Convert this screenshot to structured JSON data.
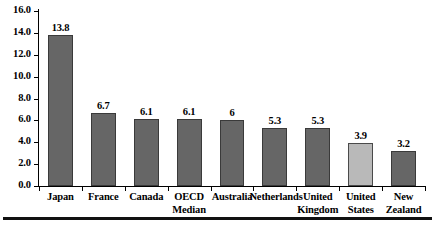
{
  "chart_data": {
    "type": "bar",
    "title": "",
    "subtitle": "",
    "xlabel": "",
    "ylabel": "",
    "ylim": [
      0,
      16
    ],
    "grid": false,
    "legend": "none",
    "categories": [
      "Japan",
      "France",
      "Canada",
      "OECD\nMedian",
      "Australia",
      "Netherlands",
      "United\nKingdom",
      "United\nStates",
      "New\nZealand"
    ],
    "values": [
      13.8,
      6.7,
      6.1,
      6.1,
      6,
      5.3,
      5.3,
      3.9,
      3.2
    ],
    "value_labels": [
      "13.8",
      "6.7",
      "6.1",
      "6.1",
      "6",
      "5.3",
      "5.3",
      "3.9",
      "3.2"
    ],
    "bar_styles": [
      "dark",
      "dark",
      "dark",
      "dark",
      "dark",
      "dark",
      "dark",
      "light",
      "dark"
    ],
    "yticks": [
      {
        "value": 16,
        "label": "16.0"
      },
      {
        "value": 14,
        "label": "14.0"
      },
      {
        "value": 12,
        "label": "12.0"
      },
      {
        "value": 10,
        "label": "10.0"
      },
      {
        "value": 8,
        "label": "8.0"
      },
      {
        "value": 6,
        "label": "6.0"
      },
      {
        "value": 4,
        "label": "4.0"
      },
      {
        "value": 2,
        "label": "2.0"
      },
      {
        "value": 0,
        "label": "0.0"
      }
    ],
    "colors": {
      "bar_dark_fill": "#666666",
      "bar_dark_border": "#3a3a3a",
      "bar_light_fill": "#b9b9b9",
      "bar_light_border": "#4a4a4a",
      "axis": "#000000",
      "text": "#000000",
      "background": "#ffffff",
      "rule": "#111111"
    }
  }
}
